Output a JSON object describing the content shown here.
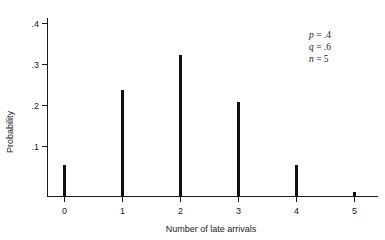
{
  "chart_data": {
    "type": "bar",
    "title": "",
    "subtitle": "",
    "xlabel": "Number of late arrivals",
    "ylabel": "Probability",
    "categories": [
      "0",
      "1",
      "2",
      "3",
      "4",
      "5"
    ],
    "values": [
      0.0778,
      0.2592,
      0.3456,
      0.2304,
      0.0768,
      0.0102
    ],
    "series": [
      {
        "name": "Probability",
        "values": [
          0.0778,
          0.2592,
          0.3456,
          0.2304,
          0.0768,
          0.0102
        ]
      }
    ],
    "xlim": [
      -0.35,
      5.7
    ],
    "ylim": [
      0,
      0.44
    ],
    "xticks": [
      "0",
      "1",
      "2",
      "3",
      "4",
      "5"
    ],
    "yticks": [
      ".1",
      ".2",
      ".3",
      ".4"
    ],
    "ytick_values": [
      0.1,
      0.2,
      0.3,
      0.4
    ],
    "grid": false,
    "legend": "none",
    "bar_color": "#111111",
    "axis_color": "#1a1a1a",
    "background": "#ffffff",
    "annotations": [
      {
        "symbol": "p",
        "equals": " = ",
        "value": ".4"
      },
      {
        "symbol": "q",
        "equals": " = ",
        "value": ".6"
      },
      {
        "symbol": "n",
        "equals": " = ",
        "value": "5"
      }
    ]
  }
}
